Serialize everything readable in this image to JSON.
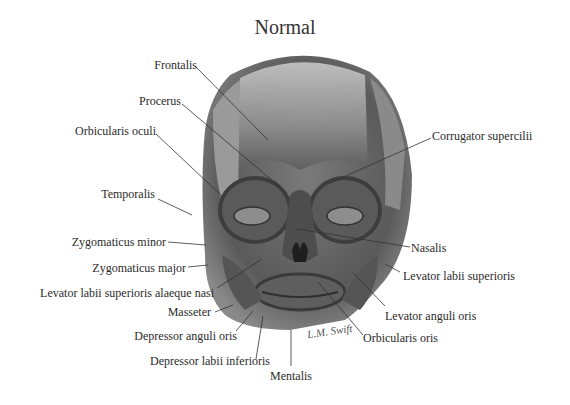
{
  "title": "Normal",
  "signature": "L.M. Swift",
  "labels": {
    "frontalis": "Frontalis",
    "procerus": "Procerus",
    "orbicularis_oculi": "Orbicularis oculi",
    "temporalis": "Temporalis",
    "zygomaticus_minor": "Zygomaticus minor",
    "zygomaticus_major": "Zygomaticus major",
    "levator_labii_alaeque_nasi": "Levator labii superioris alaeque nasi",
    "masseter": "Masseter",
    "depressor_anguli_oris": "Depressor anguli oris",
    "depressor_labii_inferioris": "Depressor labii inferioris",
    "mentalis": "Mentalis",
    "corrugator_supercilii": "Corrugator supercilii",
    "nasalis": "Nasalis",
    "levator_labii_superioris": "Levator labii superioris",
    "levator_anguli_oris": "Levator anguli oris",
    "orbicularis_oris": "Orbicularis oris"
  },
  "colors": {
    "muscle_dark": "#4a4a4a",
    "muscle_light": "#b8b8b8",
    "leader": "#333333"
  }
}
